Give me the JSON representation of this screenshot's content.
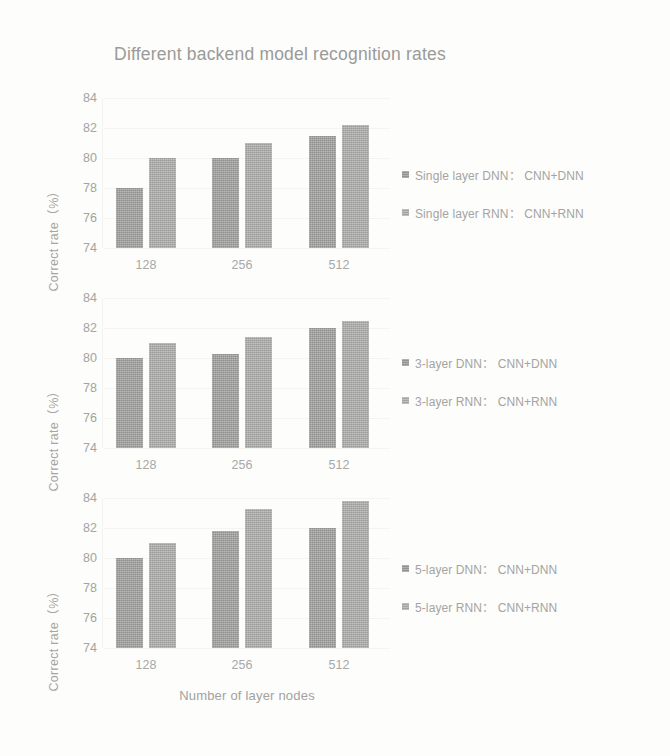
{
  "chart_data": {
    "type": "bar",
    "title": "Different backend model recognition rates",
    "xlabel": "Number of layer nodes",
    "ylabel": "Correct rate（%）",
    "categories": [
      "128",
      "256",
      "512"
    ],
    "yticks": [
      "84",
      "82",
      "80",
      "78",
      "76",
      "74"
    ],
    "ylim": [
      74,
      84
    ],
    "grid": false,
    "legend_position": "right",
    "panels": [
      {
        "id": "single-layer",
        "ylabel": "Correct rate（%）",
        "categories": [
          "128",
          "256",
          "512"
        ],
        "series": [
          {
            "name": "Single layer DNN：CNN+DNN",
            "values": [
              78.0,
              80.0,
              81.5
            ]
          },
          {
            "name": "Single layer RNN：CNN+RNN",
            "values": [
              80.0,
              81.0,
              82.2
            ]
          }
        ],
        "legend": [
          "Single layer DNN： CNN+DNN",
          "Single layer RNN： CNN+RNN"
        ]
      },
      {
        "id": "three-layer",
        "ylabel": "Correct rate（%）",
        "categories": [
          "128",
          "256",
          "512"
        ],
        "series": [
          {
            "name": "3-layer DNN：CNN+DNN",
            "values": [
              80.0,
              80.3,
              82.0
            ]
          },
          {
            "name": "3-layer RNN：CNN+RNN",
            "values": [
              81.0,
              81.4,
              82.5
            ]
          }
        ],
        "legend": [
          "3-layer DNN： CNN+DNN",
          "3-layer RNN： CNN+RNN"
        ]
      },
      {
        "id": "five-layer",
        "ylabel": "Correct rate（%）",
        "categories": [
          "128",
          "256",
          "512"
        ],
        "series": [
          {
            "name": "5-layer DNN：CNN+DNN",
            "values": [
              80.0,
              81.8,
              82.0
            ]
          },
          {
            "name": "5-layer RNN：CNN+RNN",
            "values": [
              81.0,
              83.3,
              83.8
            ]
          }
        ],
        "legend": [
          "5-layer DNN： CNN+DNN",
          "5-layer RNN： CNN+RNN"
        ]
      }
    ],
    "colors": {
      "series_0": "#9d9d9b",
      "series_1": "#aaaaa8",
      "text": "#a4a4a2",
      "background": "#fdfdfc"
    }
  }
}
